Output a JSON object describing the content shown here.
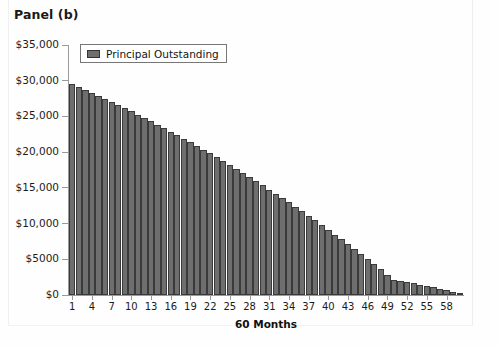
{
  "panel": {
    "title": "Panel (b)"
  },
  "legend": {
    "label": "Principal Outstanding",
    "swatch_color": "#6e6e6e",
    "position": "top-left-inside"
  },
  "chart_data": {
    "type": "bar",
    "title": "Panel (b)",
    "xlabel": "60 Months",
    "ylabel": "",
    "ylim": [
      0,
      35000
    ],
    "grid": false,
    "series": [
      {
        "name": "Principal Outstanding",
        "color": "#6e6e6e",
        "values": [
          29500,
          29100,
          28700,
          28290,
          27870,
          27450,
          27020,
          26590,
          26150,
          25700,
          25250,
          24790,
          24320,
          23850,
          23370,
          22880,
          22390,
          21890,
          21380,
          20870,
          20350,
          19820,
          19290,
          18750,
          18200,
          17650,
          17090,
          16520,
          15940,
          15360,
          14770,
          14170,
          13570,
          12960,
          12340,
          11710,
          11080,
          10440,
          9790,
          9130,
          8460,
          7790,
          7110,
          6420,
          5720,
          5020,
          4310,
          3590,
          2860,
          2120,
          1980,
          1820,
          1650,
          1470,
          1280,
          1080,
          870,
          650,
          420,
          180
        ]
      }
    ],
    "categories": [
      "1",
      "2",
      "3",
      "4",
      "5",
      "6",
      "7",
      "8",
      "9",
      "10",
      "11",
      "12",
      "13",
      "14",
      "15",
      "16",
      "17",
      "18",
      "19",
      "20",
      "21",
      "22",
      "23",
      "24",
      "25",
      "26",
      "27",
      "28",
      "29",
      "30",
      "31",
      "32",
      "33",
      "34",
      "35",
      "36",
      "37",
      "38",
      "39",
      "40",
      "41",
      "42",
      "43",
      "44",
      "45",
      "46",
      "47",
      "48",
      "49",
      "50",
      "51",
      "52",
      "53",
      "54",
      "55",
      "56",
      "57",
      "58",
      "59",
      "60"
    ],
    "yticks": [
      0,
      5000,
      10000,
      15000,
      20000,
      25000,
      30000,
      35000
    ],
    "ytick_labels": [
      "$0",
      "$5000",
      "$10,000",
      "$15,000",
      "$20,000",
      "$25,000",
      "$30,000",
      "$35,000"
    ],
    "xticks": [
      1,
      4,
      7,
      10,
      13,
      16,
      19,
      22,
      25,
      28,
      31,
      34,
      37,
      40,
      43,
      46,
      49,
      52,
      55,
      58
    ],
    "xtick_labels": [
      "1",
      "4",
      "7",
      "10",
      "13",
      "16",
      "19",
      "22",
      "25",
      "28",
      "31",
      "34",
      "37",
      "40",
      "43",
      "46",
      "49",
      "52",
      "55",
      "58"
    ]
  }
}
